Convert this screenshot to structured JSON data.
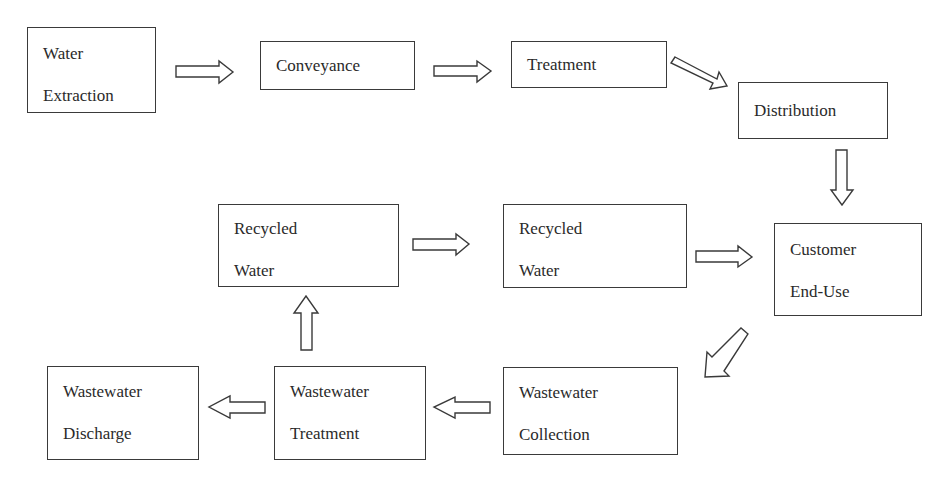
{
  "diagram": {
    "type": "flowchart",
    "nodes": {
      "water_extraction": {
        "lines": [
          "Water",
          "Extraction"
        ]
      },
      "conveyance": {
        "lines": [
          "Conveyance"
        ]
      },
      "treatment": {
        "lines": [
          "Treatment"
        ]
      },
      "distribution": {
        "lines": [
          "Distribution"
        ]
      },
      "customer_end_use": {
        "lines": [
          "Customer",
          "End-Use"
        ]
      },
      "recycled_water_1": {
        "lines": [
          "Recycled",
          "Water"
        ]
      },
      "recycled_water_2": {
        "lines": [
          "Recycled",
          "Water"
        ]
      },
      "wastewater_collection": {
        "lines": [
          "Wastewater",
          "Collection"
        ]
      },
      "wastewater_treatment": {
        "lines": [
          "Wastewater",
          "Treatment"
        ]
      },
      "wastewater_discharge": {
        "lines": [
          "Wastewater",
          "Discharge"
        ]
      }
    },
    "edges": [
      {
        "from": "Water Extraction",
        "to": "Conveyance",
        "direction": "right"
      },
      {
        "from": "Conveyance",
        "to": "Treatment",
        "direction": "right"
      },
      {
        "from": "Treatment",
        "to": "Distribution",
        "direction": "down-right"
      },
      {
        "from": "Distribution",
        "to": "Customer End-Use",
        "direction": "down"
      },
      {
        "from": "Customer End-Use",
        "to": "Wastewater Collection",
        "direction": "down-left"
      },
      {
        "from": "Wastewater Collection",
        "to": "Wastewater Treatment",
        "direction": "left"
      },
      {
        "from": "Wastewater Treatment",
        "to": "Wastewater Discharge",
        "direction": "left"
      },
      {
        "from": "Wastewater Treatment",
        "to": "Recycled Water",
        "direction": "up"
      },
      {
        "from": "Recycled Water",
        "to": "Recycled Water",
        "direction": "right"
      },
      {
        "from": "Recycled Water",
        "to": "Customer End-Use",
        "direction": "right"
      }
    ],
    "colors": {
      "stroke": "#3a3a3a",
      "fill": "#ffffff",
      "text": "#2a2a2a"
    }
  }
}
